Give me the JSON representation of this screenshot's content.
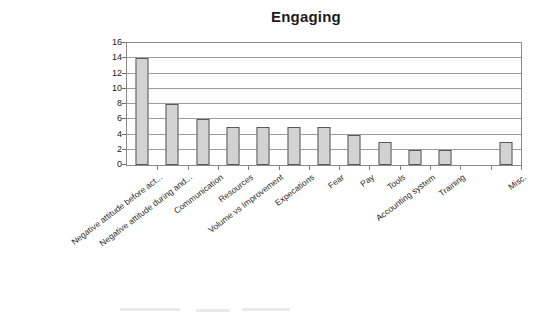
{
  "chart_data": {
    "type": "bar",
    "title": "Engaging",
    "xlabel": "",
    "ylabel": "",
    "ylim": [
      0,
      16
    ],
    "ytick_step": 2,
    "ytick_labels": [
      "16",
      "14",
      "12",
      "10",
      "8",
      "6",
      "4",
      "2",
      "0"
    ],
    "grid": true,
    "grid_axis": "y",
    "legend": false,
    "categories": [
      "Negative attitude before act...",
      "Negative attitude during and...",
      "Communication",
      "Resources",
      "Volume vs Improvement",
      "Expecations",
      "Fear",
      "Pay",
      "Tools",
      "Accounting system",
      "Training",
      "",
      "Misc."
    ],
    "values": [
      14,
      8,
      6,
      5,
      5,
      5,
      5,
      4,
      3,
      2,
      2,
      0,
      3
    ],
    "bar_fill_color": "#d2d2d2",
    "bar_border_color": "#595959",
    "plot_border_color": "#8a8a8a",
    "gridline_color": "#9d9d9d",
    "title_color": "#1c1c1c",
    "background_color": "#ffffff"
  }
}
